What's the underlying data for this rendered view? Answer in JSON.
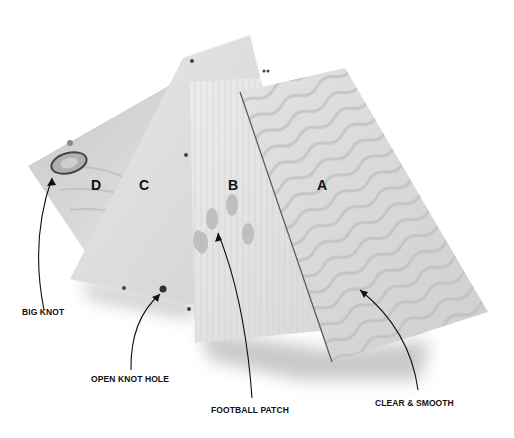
{
  "image": {
    "subject": "Four plywood panels fanned out, graded D, C, B, A",
    "background": "#ffffff"
  },
  "panels": [
    {
      "grade": "D",
      "label": "D",
      "tone": "#d4d4d4"
    },
    {
      "grade": "C",
      "label": "C",
      "tone": "#dedede"
    },
    {
      "grade": "B",
      "label": "B",
      "tone": "#e6e6e6"
    },
    {
      "grade": "A",
      "label": "A",
      "tone": "#dcdcdc"
    }
  ],
  "callouts": [
    {
      "id": "big-knot",
      "text": "BIG KNOT"
    },
    {
      "id": "open-knot-hole",
      "text": "OPEN KNOT HOLE"
    },
    {
      "id": "football-patch",
      "text": "FOOTBALL PATCH"
    },
    {
      "id": "clear-smooth",
      "text": "CLEAR & SMOOTH"
    }
  ]
}
